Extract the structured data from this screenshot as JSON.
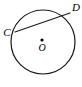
{
  "diagram": {
    "kind": "circle-with-chord",
    "background_color": "#ffffff",
    "stroke_color": "#1a1a1a",
    "label_color": "#000000",
    "canvas": {
      "width": 82,
      "height": 87
    },
    "circle": {
      "name": "circle-O",
      "center_x": 43,
      "center_y": 42,
      "radius": 32,
      "stroke_width": 1.2,
      "fill": "none"
    },
    "center_point": {
      "name": "center-point-O",
      "x": 42,
      "y": 40,
      "radius": 1.6
    },
    "labels": {
      "center": {
        "text": "O",
        "x": 42,
        "y": 51,
        "anchor": "middle"
      },
      "point_c": {
        "text": "C",
        "x": 7,
        "y": 36,
        "anchor": "middle"
      },
      "point_d": {
        "text": "D",
        "x": 76,
        "y": 11,
        "anchor": "middle"
      }
    },
    "points": [
      {
        "id": "C",
        "label": "C",
        "x": 15,
        "y": 32
      },
      {
        "id": "D",
        "label": "D",
        "x": 69,
        "y": 13
      }
    ],
    "chord": {
      "name": "chord-CD",
      "from": "C",
      "to": "D",
      "x1": 15,
      "y1": 32,
      "x2": 70,
      "y2": 13,
      "stroke_width": 1.2
    }
  }
}
